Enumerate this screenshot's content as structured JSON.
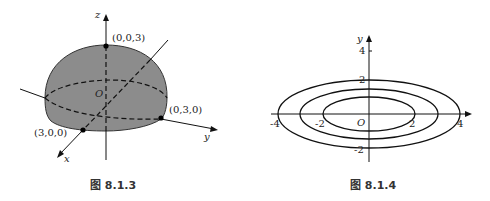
{
  "figures": [
    {
      "caption": "图 8.1.3",
      "axes": {
        "x": "x",
        "y": "y",
        "z": "z"
      },
      "origin_label": "O",
      "points": [
        {
          "label": "(0,0,3)"
        },
        {
          "label": "(0,3,0)"
        },
        {
          "label": "(3,0,0)"
        }
      ],
      "fill_color": "#8c8c8c"
    },
    {
      "caption": "图 8.1.4",
      "axes": {
        "x": "",
        "y": "y"
      },
      "origin_label": "O",
      "y_ticks": [
        "4",
        "2",
        "-2"
      ],
      "x_ticks": [
        "-4",
        "-2",
        "2",
        "4"
      ],
      "ellipses": [
        {
          "semi_x": 2,
          "semi_y": 1
        },
        {
          "semi_x": 3,
          "semi_y": 1.5
        },
        {
          "semi_x": 4,
          "semi_y": 2
        }
      ]
    }
  ]
}
